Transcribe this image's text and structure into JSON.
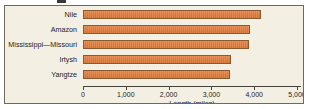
{
  "chart_data": {
    "type": "bar",
    "orientation": "horizontal",
    "title": "",
    "xlabel": "Length (miles)",
    "ylabel": "",
    "categories": [
      "Nile",
      "Amazon",
      "Mississippi—Missouri",
      "Irtysh",
      "Yangtze"
    ],
    "values": [
      4160,
      3900,
      3880,
      3450,
      3430
    ],
    "xlim": [
      0,
      5000
    ],
    "xticks": [
      0,
      1000,
      2000,
      3000,
      4000,
      5000
    ],
    "xticklabels": [
      "0",
      "1,000",
      "2,000",
      "3,000",
      "4,000",
      "5,000"
    ],
    "grid": false,
    "legend": null,
    "bar_color": "#e07b3c",
    "bar_edge_color": "#8a5a33",
    "plot_background": "#f3f0e3",
    "frame_color": "#6d6a5c",
    "axis_color": "#45423a",
    "text_color": "#23211c"
  }
}
